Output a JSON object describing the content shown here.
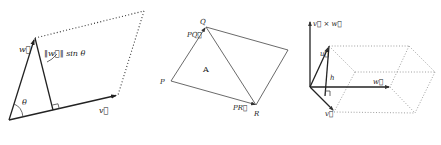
{
  "figure": {
    "panels": [
      {
        "id": "parallelogram-vectors",
        "labels": {
          "w": "w⃗",
          "v": "v⃗",
          "theta": "θ",
          "height": "‖w⃗‖ sin θ"
        }
      },
      {
        "id": "triangle-pqr",
        "labels": {
          "P": "P",
          "Q": "Q",
          "R": "R",
          "A": "A",
          "PQ": "PQ⃗",
          "PR": "PR⃗"
        }
      },
      {
        "id": "parallelepiped",
        "labels": {
          "cross": "v⃗ × w⃗",
          "u": "u⃗",
          "h": "h",
          "w": "w⃗",
          "v": "v⃗"
        }
      }
    ]
  }
}
